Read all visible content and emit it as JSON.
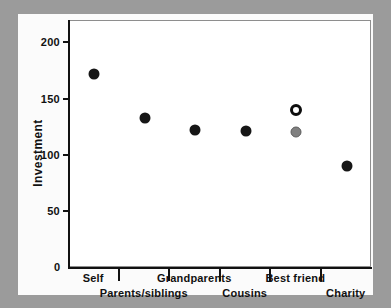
{
  "chart_data": {
    "type": "scatter",
    "title": "",
    "xlabel": "",
    "ylabel": "Investment",
    "ylim": [
      0,
      220
    ],
    "yticks": [
      0,
      50,
      100,
      150,
      200
    ],
    "ytick_labels": [
      "0",
      "50",
      "100",
      "150",
      "200"
    ],
    "grid": false,
    "legend_position": "none",
    "categories": [
      "Self",
      "Parents/siblings",
      "Grandparents",
      "Cousins",
      "Best friend",
      "Charity"
    ],
    "category_label_rows": [
      0,
      1,
      0,
      1,
      0,
      1
    ],
    "series": [
      {
        "name": "Investment (filled)",
        "marker": "filled-circle",
        "color": "#161616",
        "values": [
          173,
          134,
          123,
          122,
          null,
          91
        ]
      },
      {
        "name": "Best friend (open circle)",
        "marker": "open-circle",
        "color": "#ffffff",
        "values": [
          null,
          null,
          null,
          null,
          141,
          null
        ]
      },
      {
        "name": "Best friend (gray)",
        "marker": "gray-circle",
        "color": "#808080",
        "values": [
          null,
          null,
          null,
          null,
          121,
          null
        ]
      }
    ],
    "points": [
      {
        "category": "Self",
        "value": 173,
        "marker": "filled-circle"
      },
      {
        "category": "Parents/siblings",
        "value": 134,
        "marker": "filled-circle"
      },
      {
        "category": "Grandparents",
        "value": 123,
        "marker": "filled-circle"
      },
      {
        "category": "Cousins",
        "value": 122,
        "marker": "filled-circle"
      },
      {
        "category": "Best friend",
        "value": 141,
        "marker": "open-circle"
      },
      {
        "category": "Best friend",
        "value": 121,
        "marker": "gray-circle"
      },
      {
        "category": "Charity",
        "value": 91,
        "marker": "filled-circle"
      }
    ]
  },
  "colors": {
    "page_background": "#9b9b9b",
    "figure_background": "#fbfbfb",
    "plot_background": "#ffffff",
    "axis": "#111111",
    "frame": "#8e8e8e",
    "marker_filled": "#161616",
    "marker_gray": "#808080",
    "marker_open_stroke": "#0d0d0d"
  }
}
